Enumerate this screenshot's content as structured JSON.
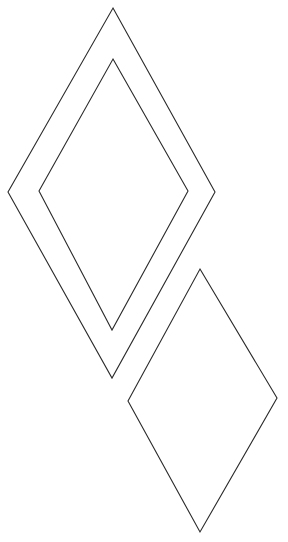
{
  "diagram": {
    "background": "#ffffff",
    "stroke_color": "#2a2a2a",
    "shapes": [
      {
        "name": "outer-diamond",
        "type": "diamond",
        "points": "113,8 215,192 112,378 8,192"
      },
      {
        "name": "inner-diamond",
        "type": "diamond",
        "points": "113,59 188,191 112,330 39,191"
      },
      {
        "name": "lower-diamond",
        "type": "diamond",
        "points": "200,269 277,398 200,532 128,401"
      }
    ]
  }
}
